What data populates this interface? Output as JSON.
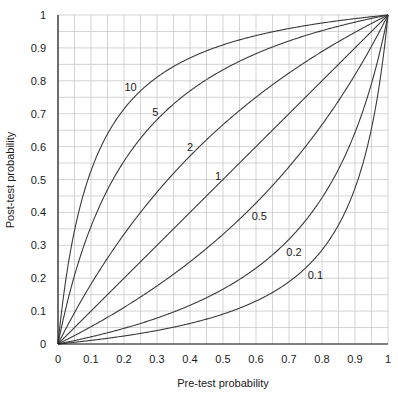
{
  "chart_data": {
    "type": "line",
    "title": "",
    "xlabel": "Pre-test probability",
    "ylabel": "Post-test probability",
    "xlim": [
      0,
      1
    ],
    "ylim": [
      0,
      1
    ],
    "grid": true,
    "grid_step": 0.05,
    "x_ticks": [
      "0",
      "0.1",
      "0.2",
      "0.3",
      "0.4",
      "0.5",
      "0.6",
      "0.7",
      "0.8",
      "0.9",
      "1"
    ],
    "y_ticks": [
      "0",
      "0.1",
      "0.2",
      "0.3",
      "0.4",
      "0.5",
      "0.6",
      "0.7",
      "0.8",
      "0.9",
      "1"
    ],
    "formula": "post = LR*p / (LR*p + 1 - p)",
    "series": [
      {
        "name": "10",
        "likelihood_ratio": 10,
        "label_pos": [
          0.22,
          0.78
        ]
      },
      {
        "name": "5",
        "likelihood_ratio": 5,
        "label_pos": [
          0.295,
          0.705
        ]
      },
      {
        "name": "2",
        "likelihood_ratio": 2,
        "label_pos": [
          0.4,
          0.6
        ]
      },
      {
        "name": "1",
        "likelihood_ratio": 1,
        "label_pos": [
          0.485,
          0.51
        ]
      },
      {
        "name": "0.5",
        "likelihood_ratio": 0.5,
        "label_pos": [
          0.61,
          0.39
        ]
      },
      {
        "name": "0.2",
        "likelihood_ratio": 0.2,
        "label_pos": [
          0.715,
          0.28
        ]
      },
      {
        "name": "0.1",
        "likelihood_ratio": 0.1,
        "label_pos": [
          0.78,
          0.21
        ]
      }
    ],
    "colors": {
      "curve": "#3a3a3a",
      "grid": "#c8c8c8",
      "axis": "#1a1a1a"
    }
  }
}
